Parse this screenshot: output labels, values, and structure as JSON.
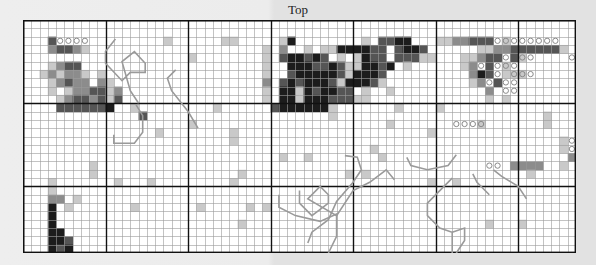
{
  "title": "Top",
  "grid": {
    "cols": 67,
    "rows": 28,
    "major_every": 10,
    "cell_px": 8.25,
    "colors": {
      "empty": "#ffffff",
      "light": "#c9c9c9",
      "mid": "#8c8c8c",
      "dark": "#555555",
      "black": "#1c1c1c",
      "minor_line": "#9a9a9a",
      "major_line": "#111111",
      "circle": "#8a8a8a",
      "path": "#9a9a9a"
    },
    "legend_codes": {
      ".": "empty",
      "1": "light",
      "2": "mid",
      "3": "dark",
      "4": "black",
      "o": "circle-on-empty",
      "O": "circle-on-light"
    },
    "cells": [
      "...................................................................",
      "...................................................................",
      "...3oooo.........1......11.....14........1.3344...1122333oOoooooo.....1..........11......",
      "...23321.....................1.2..1.11444433.3443......11223333331....oOoooo..........32...",
      "....................1........1.344343.1.1433.33311...11233o3Oo....o..................1333..",
      "...1233......................1..4443343114434.1......12o3oOo...................1.222.2.....",
      "..121221.1...................1..344444314443..........243o1OOo..................1..12......",
      "...12322.21..................2.3434443144431..........12o3oo..................1...2........",
      "...1.1223312.................1.441434433.1..1...........2.oo..........................1....",
      "....12332313.................1.44144433311..............1.1...........1........1.......1.o",
      "....3333334..1.........1......34444441.......1....1..............................oOo.....",
      "..............3......................1.........................1...1..1..........1......",
      "....................1.......................1.......oooO.......1.........oooOo.....o1.....",
      "................1........1.......................1.......................11...o.....1..2..",
      ".........................1.......................................1oooo2........23.3.o1.1..",
      "..........................................1......................1o2o3ooo.........3314.o.4.",
      "...............................1..1........1......................233122o......o3o133o.22.",
      "........1...............................................oo.2222..1........o3o3oo1111..2..",
      "........1.................1............1.1...................1..............o.oo.........",
      "...1.......1...1.........1.......................1..1...........................o1.......",
      "...1..................................................................................4.",
      "...22.1......................................................................1.......4.",
      "...4.1.......1.......1.....1.1...............................................1.......4.",
      "...4..........................................................................1........",
      "...4......................1.............................1...1.................3......",
      "...44.............................................................................1..",
      "...443.............................................................................",
      "...434..........................................................................."
    ]
  },
  "paths": [
    {
      "name": "path-top-left",
      "points": [
        [
          11.2,
          2.3
        ],
        [
          10.0,
          3.8
        ],
        [
          10.0,
          5.2
        ],
        [
          12.0,
          7.3
        ],
        [
          13.0,
          6.3
        ],
        [
          14.8,
          6.3
        ],
        [
          14.8,
          5.2
        ],
        [
          13.5,
          3.8
        ],
        [
          12.0,
          5.0
        ],
        [
          13.0,
          8.5
        ],
        [
          14.0,
          10.0
        ]
      ]
    },
    {
      "name": "path-left-loop",
      "points": [
        [
          13.7,
          10.2
        ],
        [
          14.5,
          11.5
        ],
        [
          14.5,
          13.5
        ],
        [
          13.5,
          14.8
        ],
        [
          11.0,
          14.8
        ],
        [
          11.0,
          13.8
        ]
      ]
    },
    {
      "name": "path-center",
      "points": [
        [
          18.5,
          6.0
        ],
        [
          17.5,
          7.0
        ],
        [
          18.0,
          8.5
        ],
        [
          20.0,
          11.0
        ],
        [
          21.2,
          13.0
        ]
      ]
    },
    {
      "name": "path-center-mid",
      "points": [
        [
          33.5,
          20.5
        ],
        [
          33.5,
          22.0
        ],
        [
          35.0,
          23.5
        ],
        [
          37.0,
          22.0
        ],
        [
          37.0,
          21.0
        ],
        [
          36.0,
          20.0
        ],
        [
          34.5,
          21.5
        ],
        [
          38.0,
          23.5
        ],
        [
          40.0,
          20.5
        ],
        [
          42.0,
          19.5
        ],
        [
          44.0,
          18.0
        ],
        [
          45.0,
          19.2
        ]
      ]
    },
    {
      "name": "path-center-mid2",
      "points": [
        [
          39.0,
          16.3
        ],
        [
          40.5,
          16.5
        ],
        [
          41.0,
          18.0
        ],
        [
          40.0,
          19.5
        ],
        [
          38.0,
          21.8
        ],
        [
          37.0,
          24.0
        ],
        [
          35.0,
          25.5
        ],
        [
          34.5,
          26.8
        ]
      ]
    },
    {
      "name": "path-bottom-mid",
      "points": [
        [
          31.0,
          21.0
        ],
        [
          31.0,
          22.5
        ],
        [
          33.0,
          23.5
        ],
        [
          36.0,
          24.2
        ],
        [
          38.0,
          23.3
        ],
        [
          38.0,
          26.0
        ],
        [
          37.0,
          28.0
        ]
      ]
    },
    {
      "name": "path-right-mid",
      "points": [
        [
          46.5,
          16.5
        ],
        [
          47.0,
          17.5
        ],
        [
          49.0,
          18.0
        ],
        [
          51.5,
          17.5
        ],
        [
          52.5,
          16.2
        ]
      ]
    },
    {
      "name": "path-right-lower",
      "points": [
        [
          57.0,
          18.0
        ],
        [
          58.0,
          18.8
        ],
        [
          60.0,
          20.0
        ],
        [
          61.0,
          21.5
        ]
      ]
    },
    {
      "name": "path-right-bottom",
      "points": [
        [
          52.0,
          19.0
        ],
        [
          50.5,
          20.5
        ],
        [
          49.0,
          22.0
        ],
        [
          49.0,
          23.5
        ],
        [
          50.5,
          25.0
        ],
        [
          52.0,
          25.5
        ],
        [
          52.0,
          28.0
        ]
      ]
    },
    {
      "name": "path-right-bottom2",
      "points": [
        [
          52.0,
          25.5
        ],
        [
          53.5,
          25.0
        ],
        [
          53.5,
          26.5
        ],
        [
          52.5,
          28.0
        ]
      ]
    },
    {
      "name": "path-right-edge",
      "points": [
        [
          54.5,
          18.5
        ],
        [
          55.0,
          19.5
        ],
        [
          56.5,
          21.0
        ]
      ]
    }
  ]
}
